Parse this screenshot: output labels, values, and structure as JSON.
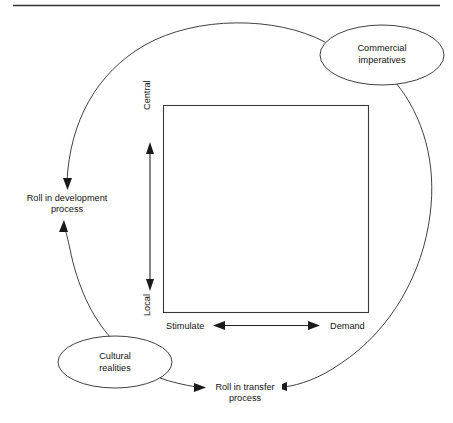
{
  "figure": {
    "title": "",
    "colors": {
      "stroke": "#2b2b2b",
      "text": "#141414",
      "background": "#ffffff",
      "rule": "#333333"
    },
    "top_rule": true,
    "center_square_label": "",
    "axes": {
      "vertical": {
        "top_label": "Central",
        "bottom_label": "Local",
        "orientation": "vertical",
        "double_headed": true
      },
      "horizontal": {
        "left_label": "Stimulate",
        "right_label": "Demand",
        "orientation": "horizontal",
        "double_headed": true
      }
    },
    "nodes": [
      {
        "id": "commercial-imperatives",
        "shape": "ellipse",
        "line1": "Commercial",
        "line2": "imperatives"
      },
      {
        "id": "cultural-realities",
        "shape": "ellipse",
        "line1": "Cultural",
        "line2": "realities"
      }
    ],
    "process_labels": [
      {
        "id": "development-process",
        "line1": "Roll in development",
        "line2": "process"
      },
      {
        "id": "transfer-process",
        "line1": "Roll in transfer",
        "line2": "process"
      }
    ],
    "connectors": [
      {
        "id": "commercial-to-development",
        "from": "commercial-imperatives",
        "to": "development-process",
        "arrow": "to"
      },
      {
        "id": "commercial-to-transfer",
        "from": "commercial-imperatives",
        "to": "transfer-process",
        "arrow": "to"
      },
      {
        "id": "cultural-to-development",
        "from": "cultural-realities",
        "to": "development-process",
        "arrow": "to"
      },
      {
        "id": "cultural-to-transfer",
        "from": "cultural-realities",
        "to": "transfer-process",
        "arrow": "to"
      }
    ]
  }
}
